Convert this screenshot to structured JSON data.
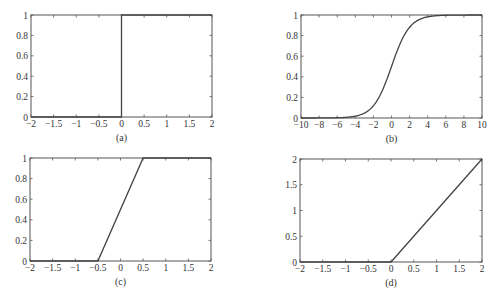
{
  "figure": {
    "background": "#ffffff",
    "axis_color": "#555555",
    "line_color": "#444444"
  },
  "chart_data": [
    {
      "id": "a",
      "caption": "(a)",
      "type": "line",
      "title": "",
      "xlabel": "",
      "ylabel": "",
      "xlim": [
        -2,
        2
      ],
      "ylim": [
        0,
        1
      ],
      "xticks": [
        -2,
        -1.5,
        -1,
        -0.5,
        0,
        0.5,
        1,
        1.5,
        2
      ],
      "xtick_labels": [
        "-2",
        "-1.5",
        "-1",
        "-0.5",
        "0",
        "0.5",
        "1",
        "1.5",
        "2"
      ],
      "yticks": [
        0,
        0.2,
        0.4,
        0.6,
        0.8,
        1
      ],
      "ytick_labels": [
        "0",
        "0.2",
        "0.4",
        "0.6",
        "0.8",
        "1"
      ],
      "grid": false,
      "function": "step",
      "series": [
        {
          "name": "step",
          "x": [
            -2,
            0,
            0,
            2
          ],
          "y": [
            0,
            0,
            1,
            1
          ]
        }
      ],
      "box": {
        "left": 31,
        "top": 15,
        "right": 212,
        "bottom": 117
      }
    },
    {
      "id": "b",
      "caption": "(b)",
      "type": "line",
      "title": "",
      "xlabel": "",
      "ylabel": "",
      "xlim": [
        -10,
        10
      ],
      "ylim": [
        0,
        1
      ],
      "xticks": [
        -10,
        -8,
        -6,
        -4,
        -2,
        0,
        2,
        4,
        6,
        8,
        10
      ],
      "xtick_labels": [
        "-10",
        "-8",
        "-6",
        "-4",
        "-2",
        "0",
        "2",
        "4",
        "6",
        "8",
        "10"
      ],
      "yticks": [
        0,
        0.2,
        0.4,
        0.6,
        0.8,
        1
      ],
      "ytick_labels": [
        "0",
        "0.2",
        "0.4",
        "0.6",
        "0.8",
        "1"
      ],
      "grid": false,
      "function": "sigmoid",
      "series": [
        {
          "name": "sigmoid",
          "x": [
            -10,
            -8,
            -6,
            -5,
            -4,
            -3,
            -2,
            -1,
            0,
            1,
            2,
            3,
            4,
            5,
            6,
            8,
            10
          ],
          "y": [
            0.0,
            0.0003,
            0.0025,
            0.0067,
            0.018,
            0.047,
            0.119,
            0.269,
            0.5,
            0.731,
            0.881,
            0.953,
            0.982,
            0.9933,
            0.9975,
            0.9997,
            1.0
          ]
        }
      ],
      "box": {
        "left": 301,
        "top": 15,
        "right": 482,
        "bottom": 118
      }
    },
    {
      "id": "c",
      "caption": "(c)",
      "type": "line",
      "title": "",
      "xlabel": "",
      "ylabel": "",
      "xlim": [
        -2,
        2
      ],
      "ylim": [
        0,
        1
      ],
      "xticks": [
        -2,
        -1.5,
        -1,
        -0.5,
        0,
        0.5,
        1,
        1.5,
        2
      ],
      "xtick_labels": [
        "-2",
        "-1.5",
        "-1",
        "-0.5",
        "0",
        "0.5",
        "1",
        "1.5",
        "2"
      ],
      "yticks": [
        0,
        0.2,
        0.4,
        0.6,
        0.8,
        1
      ],
      "ytick_labels": [
        "0",
        "0.2",
        "0.4",
        "0.6",
        "0.8",
        "1"
      ],
      "grid": false,
      "function": "piecewise-linear",
      "series": [
        {
          "name": "piecewise linear",
          "x": [
            -2,
            -0.5,
            0.5,
            2
          ],
          "y": [
            0,
            0,
            1,
            1
          ]
        }
      ],
      "box": {
        "left": 30,
        "top": 158,
        "right": 211,
        "bottom": 261
      }
    },
    {
      "id": "d",
      "caption": "(d)",
      "type": "line",
      "title": "",
      "xlabel": "",
      "ylabel": "",
      "xlim": [
        -2,
        2
      ],
      "ylim": [
        0,
        2
      ],
      "xticks": [
        -2,
        -1.5,
        -1,
        -0.5,
        0,
        0.5,
        1,
        1.5,
        2
      ],
      "xtick_labels": [
        "-2",
        "-1.5",
        "-1",
        "-0.5",
        "0",
        "0.5",
        "1",
        "1.5",
        "2"
      ],
      "yticks": [
        0,
        0.5,
        1,
        1.5,
        2
      ],
      "ytick_labels": [
        "0",
        "0.5",
        "1",
        "1.5",
        "2"
      ],
      "grid": false,
      "function": "relu",
      "series": [
        {
          "name": "ReLU",
          "x": [
            -2,
            0,
            2
          ],
          "y": [
            0,
            0,
            2
          ]
        }
      ],
      "box": {
        "left": 300,
        "top": 159,
        "right": 482,
        "bottom": 262
      }
    }
  ]
}
